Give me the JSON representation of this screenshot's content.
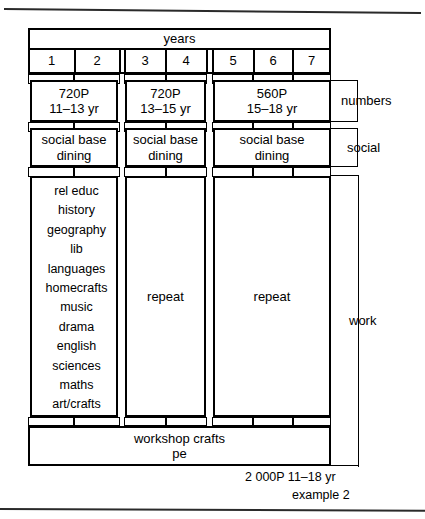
{
  "figure": {
    "caption_lines": [
      "2 000P 11–18 yr",
      "example 2"
    ],
    "header_label": "years"
  },
  "years": {
    "label": "years",
    "ticks": [
      "1",
      "2",
      "3",
      "4",
      "5",
      "6",
      "7"
    ]
  },
  "groups": [
    {
      "id": "group-1",
      "years": [
        "1",
        "2"
      ],
      "numbers": {
        "capacity": "720P",
        "age_range": "11–13 yr"
      },
      "social": {
        "line1": "social base",
        "line2": "dining"
      },
      "work": {
        "kind": "subject-list",
        "subjects": [
          "rel educ",
          "history",
          "geography",
          "lib",
          "languages",
          "homecrafts",
          "music",
          "drama",
          "english",
          "sciences",
          "maths",
          "art/crafts"
        ]
      }
    },
    {
      "id": "group-2",
      "years": [
        "3",
        "4"
      ],
      "numbers": {
        "capacity": "720P",
        "age_range": "13–15 yr"
      },
      "social": {
        "line1": "social base",
        "line2": "dining"
      },
      "work": {
        "kind": "repeat",
        "label": "repeat"
      }
    },
    {
      "id": "group-3",
      "years": [
        "5",
        "6",
        "7"
      ],
      "numbers": {
        "capacity": "560P",
        "age_range": "15–18 yr"
      },
      "social": {
        "line1": "social base",
        "line2": "dining"
      },
      "work": {
        "kind": "repeat",
        "label": "repeat"
      }
    }
  ],
  "bands": [
    {
      "id": "numbers",
      "label": "numbers"
    },
    {
      "id": "social",
      "label": "social"
    },
    {
      "id": "work",
      "label": "work"
    }
  ],
  "shared": {
    "line1": "workshop crafts",
    "line2": "pe"
  },
  "colors": {
    "ink": "#000000",
    "paper": "#ffffff",
    "rule": "#2a2a2a"
  }
}
